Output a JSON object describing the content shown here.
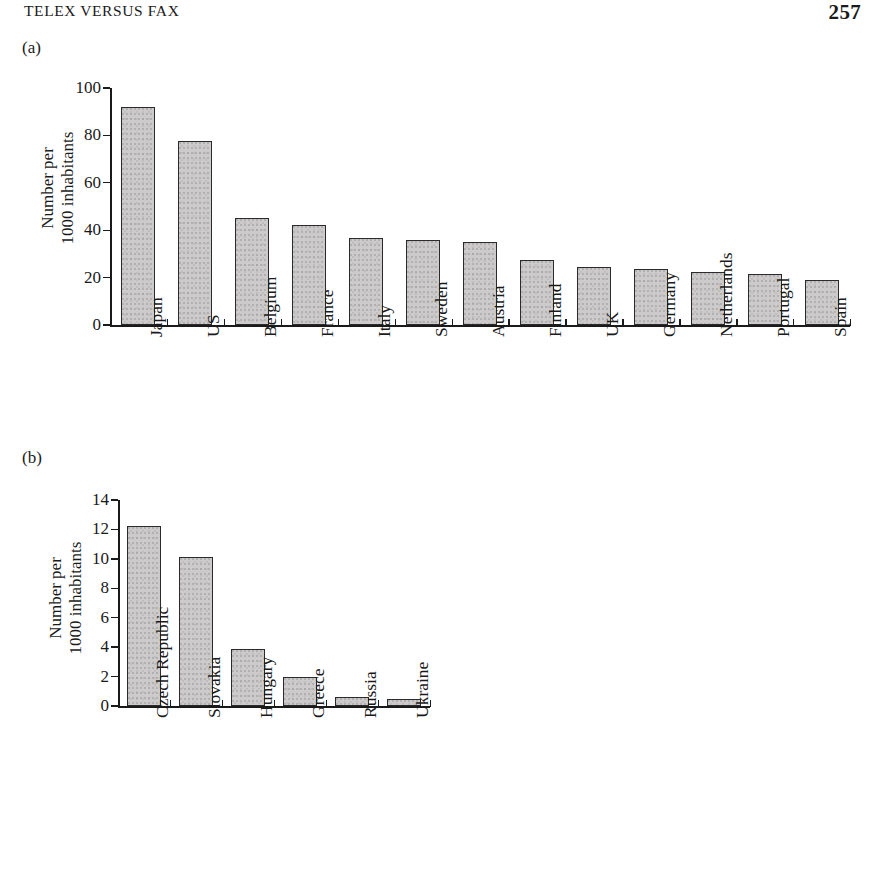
{
  "header": {
    "running_title": "TELEX VERSUS FAX",
    "page_number": "257"
  },
  "panels": {
    "a": {
      "label": "(a)",
      "ylabel_line1": "Number per",
      "ylabel_line2": "1000 inhabitants"
    },
    "b": {
      "label": "(b)",
      "ylabel_line1": "Number per",
      "ylabel_line2": "1000 inhabitants"
    }
  },
  "chart_data": [
    {
      "type": "bar",
      "panel": "(a)",
      "title": "",
      "xlabel": "",
      "ylabel": "Number per 1000 inhabitants",
      "ylim": [
        0,
        100
      ],
      "yticks": [
        0,
        20,
        40,
        60,
        80,
        100
      ],
      "ytick_labels": [
        "0",
        "20",
        "40",
        "60",
        "80",
        "100"
      ],
      "grid": false,
      "legend": "none",
      "categories": [
        "Japan",
        "US",
        "Belgium",
        "France",
        "Italy",
        "Sweden",
        "Austria",
        "Finland",
        "UK",
        "Germany",
        "Netherlands",
        "Portugal",
        "Spain"
      ],
      "values": [
        92,
        77.5,
        45,
        42,
        36.5,
        35.8,
        35.2,
        27.5,
        24.5,
        23.5,
        22.5,
        21.5,
        18.8
      ]
    },
    {
      "type": "bar",
      "panel": "(b)",
      "title": "",
      "xlabel": "",
      "ylabel": "Number per 1000 inhabitants",
      "ylim": [
        0,
        14
      ],
      "yticks": [
        0,
        2,
        4,
        6,
        8,
        10,
        12,
        14
      ],
      "ytick_labels": [
        "0",
        "2",
        "4",
        "6",
        "8",
        "10",
        "12",
        "14"
      ],
      "grid": false,
      "legend": "none",
      "categories": [
        "Czech Republic",
        "Slovakia",
        "Hungary",
        "Greece",
        "Russia",
        "Ukraine"
      ],
      "values": [
        12.2,
        10.15,
        3.9,
        2.0,
        0.6,
        0.45
      ]
    }
  ]
}
